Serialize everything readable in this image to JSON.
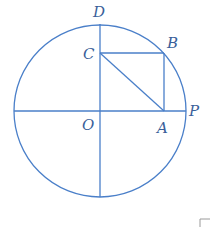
{
  "figure": {
    "colors": {
      "line": "#4a7fc9",
      "label": "#3a5f9a"
    },
    "labels": {
      "D": "D",
      "C": "C",
      "B": "B",
      "O": "O",
      "A": "A",
      "P": "P"
    }
  }
}
